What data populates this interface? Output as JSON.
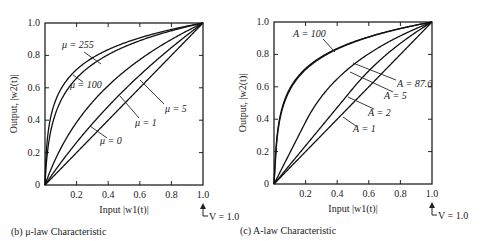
{
  "chart_data": [
    {
      "type": "line",
      "panel": "b",
      "caption": "(b) μ-law Characteristic",
      "xlabel": "Input |w1(t)|",
      "ylabel": "Output, |w2(t)|",
      "xlim": [
        0,
        1.0
      ],
      "ylim": [
        0,
        1.0
      ],
      "xticks": [
        "0.2",
        "0.4",
        "0.6",
        "0.8",
        "1.0"
      ],
      "yticks": [
        "0",
        "0.2",
        "0.4",
        "0.6",
        "0.8",
        "1.0"
      ],
      "annotation": "V = 1.0",
      "law": "mu",
      "series": [
        {
          "name": "μ = 255",
          "param": 255
        },
        {
          "name": "μ = 100",
          "param": 100
        },
        {
          "name": "μ = 5",
          "param": 5
        },
        {
          "name": "μ = 1",
          "param": 1
        },
        {
          "name": "μ = 0",
          "param": 0
        }
      ]
    },
    {
      "type": "line",
      "panel": "c",
      "caption": "(c) A-law Characteristic",
      "xlabel": "Input |w1(t)|",
      "ylabel": "Output, |w2(t)|",
      "xlim": [
        0,
        1.0
      ],
      "ylim": [
        0,
        1.0
      ],
      "xticks": [
        "0.2",
        "0.4",
        "0.6",
        "0.8",
        "1.0"
      ],
      "yticks": [
        "0",
        "0.2",
        "0.4",
        "0.6",
        "0.8",
        "1.0"
      ],
      "annotation": "V = 1.0",
      "law": "A",
      "series": [
        {
          "name": "A = 100",
          "param": 100
        },
        {
          "name": "A = 87.6",
          "param": 87.6
        },
        {
          "name": "A = 5",
          "param": 5
        },
        {
          "name": "A = 2",
          "param": 2
        },
        {
          "name": "A = 1",
          "param": 1
        }
      ]
    }
  ]
}
